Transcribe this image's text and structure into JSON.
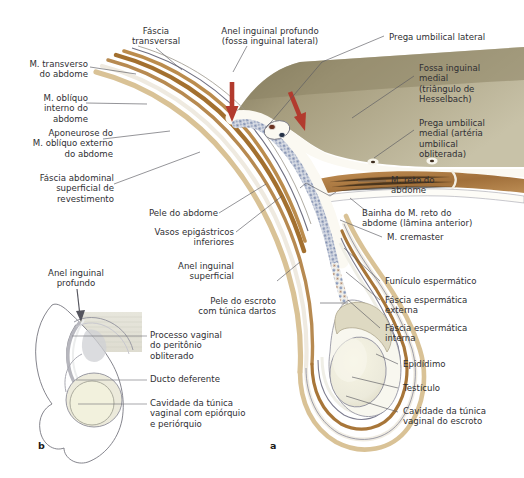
{
  "figure": {
    "panel_a_label": "a",
    "panel_b_label": "b"
  },
  "colors": {
    "peritoneum": "#b3ab8c",
    "peritoneum_dark": "#8e8567",
    "muscle": "#a97a42",
    "muscle_light": "#c79a63",
    "skin": "#d8c49a",
    "fascia": "#8f8f9e",
    "cord_vessels": "#7d90b5",
    "testis": "#eceadb",
    "arrow_red": "#b23b2e",
    "leader": "#5b5b62",
    "text": "#2f2f33"
  },
  "labels": {
    "transversus": "M. transverso\ndo abdome",
    "obliquus_internus": "M. oblíquo\ninterno do\nabdome",
    "aponeurosis": "Aponeurose do\nM. oblíquo externo\ndo abdome",
    "fascia_superficialis": "Fáscia abdominal\nsuperficial de\nrevestimento",
    "fascia_transversalis": "Fáscia\ntransversal",
    "deep_inguinal_ring": "Anel inguinal profundo\n(fossa inguinal lateral)",
    "lateral_umbilical_fold": "Prega umbilical lateral",
    "medial_inguinal_fossa": "Fossa inguinal\nmedial\n(triângulo de\nHesselbach)",
    "medial_umbilical_fold": "Prega umbilical\nmedial (artéria\numbilical\nobliterada)",
    "rectus_abdominis": "M. reto do\nabdome",
    "rectus_sheath": "Bainha do M. reto do\nabdome (lâmina anterior)",
    "cremaster": "M. cremaster",
    "spermatic_cord": "Funículo espermático",
    "external_spermatic_fascia": "Fáscia espermática\nexterna",
    "internal_spermatic_fascia": "Fáscia espermática\ninterna",
    "epididymis": "Epidídimo",
    "testis": "Testículo",
    "tunica_cavity_scrotum": "Cavidade da túnica\nvaginal do escroto",
    "skin_abdomen": "Pele do abdome",
    "inferior_epigastric": "Vasos epigástricos\ninferiores",
    "superficial_inguinal_ring": "Anel inguinal\nsuperficial",
    "scrotum_skin": "Pele do escroto\ncom túnica dartos",
    "b_deep_inguinal_ring": "Anel inguinal\nprofundo",
    "b_processus_vaginalis": "Processo vaginal\ndo peritônio\nobliterado",
    "b_ductus_deferens": "Ducto deferente",
    "b_tunica_cavity": "Cavidade da túnica\nvaginal com epiórquio\ne periórquio"
  }
}
